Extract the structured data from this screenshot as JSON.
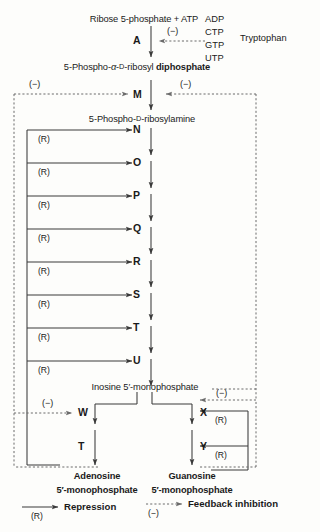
{
  "diagram": {
    "colors": {
      "ink": "#1a1a1a",
      "line": "#3a3a3a",
      "dashed": "#6b6b6b",
      "background": "#fdfdfb"
    }
  },
  "substrates": {
    "ribose_5_phosphate": "Ribose 5-phosphate + ATP",
    "prpp": "5-Phospho-α-D-ribosyl diphosphate",
    "pra": "5-Phospho-D-ribosylamine",
    "imp": "Inosine 5′-monophosphate",
    "amp_line1": "Adenosine",
    "amp_line2": "5′-monophosphate",
    "gmp_line1": "Guanosine",
    "gmp_line2": "5′-monophosphate"
  },
  "inhibitors": {
    "adp": "ADP",
    "ctp": "CTP",
    "gtp": "GTP",
    "utp": "UTP",
    "tryptophan": "Tryptophan"
  },
  "enzymes": {
    "a": "A",
    "m": "M",
    "n": "N",
    "o": "O",
    "p": "P",
    "q": "Q",
    "r": "R",
    "s": "S",
    "t": "T",
    "u": "U",
    "w": "W",
    "t2": "T",
    "x": "X",
    "y": "Y"
  },
  "marks": {
    "minus": "(−)",
    "repression": "(R)"
  },
  "repression_arrows": [
    {
      "target": "N",
      "label": "(R)"
    },
    {
      "target": "O",
      "label": "(R)"
    },
    {
      "target": "P",
      "label": "(R)"
    },
    {
      "target": "Q",
      "label": "(R)"
    },
    {
      "target": "R",
      "label": "(R)"
    },
    {
      "target": "S",
      "label": "(R)"
    },
    {
      "target": "T",
      "label": "(R)"
    },
    {
      "target": "U",
      "label": "(R)"
    }
  ],
  "feedback_minus_labels": [
    {
      "id": "minus-top-a",
      "label": "(−)"
    },
    {
      "id": "minus-left-m",
      "label": "(−)"
    },
    {
      "id": "minus-right-m",
      "label": "(−)"
    },
    {
      "id": "minus-w",
      "label": "(−)"
    },
    {
      "id": "minus-x",
      "label": "(−)"
    }
  ],
  "gmp_repression_labels": [
    {
      "id": "r-into-x",
      "label": "(R)"
    },
    {
      "id": "r-into-y",
      "label": "(R)"
    }
  ],
  "legend": {
    "repression": "Repression",
    "repression_mark": "(R)",
    "feedback": "Feedback inhibition",
    "feedback_mark": "(−)"
  }
}
